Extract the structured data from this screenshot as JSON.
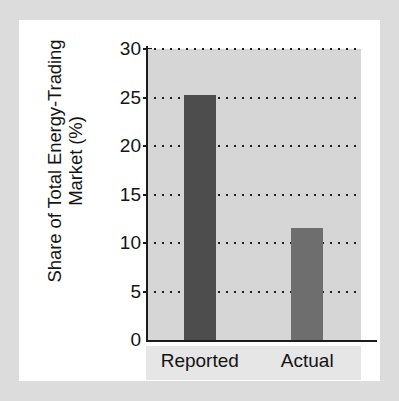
{
  "chart_data": {
    "type": "bar",
    "title": "",
    "subtitle": "",
    "xlabel": "",
    "ylabel_line1": "Share of Total Energy-Trading",
    "ylabel_line2": "Market (%)",
    "ylabel": "Share of Total Energy-Trading Market (%)",
    "categories": [
      "Reported",
      "Actual"
    ],
    "values": [
      25.3,
      11.5
    ],
    "series": [
      {
        "name": "Share of Total Energy-Trading Market (%)",
        "values": [
          25.3,
          11.5
        ]
      }
    ],
    "ylim": [
      0,
      30
    ],
    "xlim_categories": 2,
    "yticks": [
      0,
      5,
      10,
      15,
      20,
      25,
      30
    ],
    "ytick_labels": [
      "0",
      "5",
      "10",
      "15",
      "20",
      "25",
      "30"
    ],
    "grid": "horizontal-dotted",
    "legend": "none",
    "legend_position": "none",
    "annotations": [],
    "colors": {
      "bar_reported": "#4d4d4d",
      "bar_actual": "#6e6e6e",
      "plot_background": "#d6d6d6",
      "axis_line": "#1c1c1c",
      "gridline": "#1f1f1f",
      "text": "#141414",
      "panel_background": "#ffffff",
      "page_border": "#dcdcdc",
      "xlabel_strip": "#e6e6e6"
    }
  }
}
